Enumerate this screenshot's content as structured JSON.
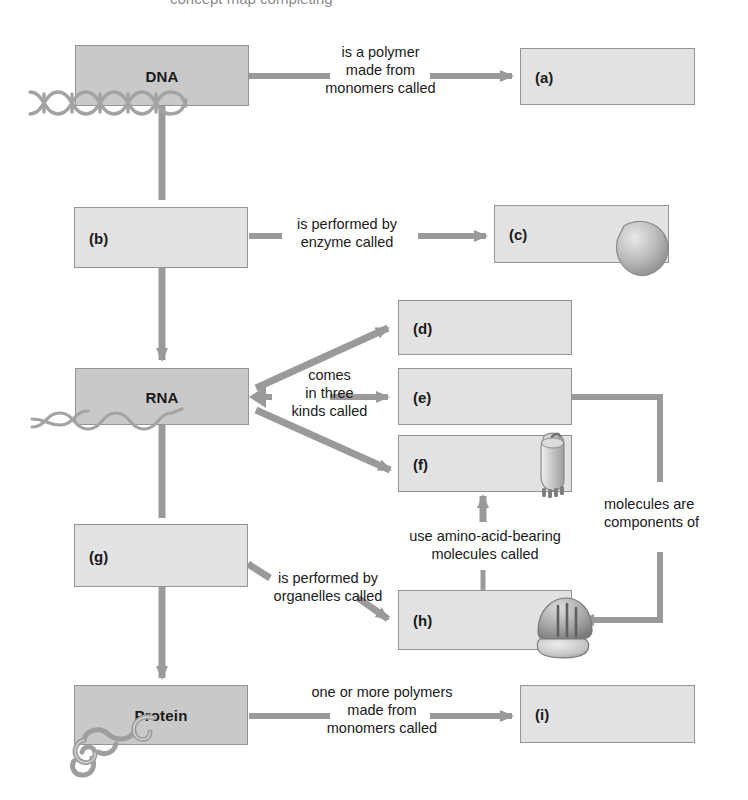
{
  "diagram": {
    "title_partial": "concept map completing",
    "type": "concept-map",
    "topic": "DNA to RNA to Protein (Central Dogma)",
    "colors": {
      "node_shaded_fill": "#c9c9c9",
      "node_light_fill": "#e2e2e2",
      "node_border": "#949494",
      "arrow": "#9a9a9a",
      "text": "#1a1a1a",
      "background": "#ffffff"
    },
    "nodes": [
      {
        "id": "dna",
        "label": "DNA",
        "style": "shaded",
        "align": "center",
        "x": 75,
        "y": 45,
        "w": 174,
        "h": 61
      },
      {
        "id": "a",
        "label": "(a)",
        "style": "light",
        "align": "left",
        "x": 520,
        "y": 48,
        "w": 175,
        "h": 57
      },
      {
        "id": "b",
        "label": "(b)",
        "style": "light",
        "align": "left",
        "x": 74,
        "y": 207,
        "w": 174,
        "h": 61
      },
      {
        "id": "c",
        "label": "(c)",
        "style": "light",
        "align": "left",
        "x": 494,
        "y": 205,
        "w": 175,
        "h": 58
      },
      {
        "id": "rna",
        "label": "RNA",
        "style": "shaded",
        "align": "center",
        "x": 75,
        "y": 368,
        "w": 174,
        "h": 57
      },
      {
        "id": "d",
        "label": "(d)",
        "style": "light",
        "align": "left",
        "x": 398,
        "y": 300,
        "w": 174,
        "h": 55
      },
      {
        "id": "e",
        "label": "(e)",
        "style": "light",
        "align": "left",
        "x": 398,
        "y": 368,
        "w": 174,
        "h": 57
      },
      {
        "id": "f",
        "label": "(f)",
        "style": "light",
        "align": "left",
        "x": 398,
        "y": 435,
        "w": 174,
        "h": 57
      },
      {
        "id": "g",
        "label": "(g)",
        "style": "light",
        "align": "left",
        "x": 74,
        "y": 524,
        "w": 174,
        "h": 63
      },
      {
        "id": "h",
        "label": "(h)",
        "style": "light",
        "align": "left",
        "x": 398,
        "y": 590,
        "w": 174,
        "h": 60
      },
      {
        "id": "protein",
        "label": "Protein",
        "style": "shaded",
        "align": "center",
        "x": 74,
        "y": 685,
        "w": 174,
        "h": 60
      },
      {
        "id": "i",
        "label": "(i)",
        "style": "light",
        "align": "left",
        "x": 520,
        "y": 685,
        "w": 175,
        "h": 58
      }
    ],
    "edge_labels": [
      {
        "id": "dna-to-a",
        "text": "is a polymer\nmade from\nmonomers called",
        "align": "center",
        "x": 268,
        "y": 44,
        "w": 225
      },
      {
        "id": "b-to-c",
        "text": "is performed by\nenzyme called",
        "align": "center",
        "x": 272,
        "y": 216,
        "w": 150
      },
      {
        "id": "rna-kinds",
        "text": "comes\nin three\nkinds called",
        "align": "center",
        "x": 272,
        "y": 367,
        "w": 115
      },
      {
        "id": "e-to-h",
        "text": "molecules are\ncomponents of",
        "align": "left",
        "x": 604,
        "y": 496,
        "w": 144
      },
      {
        "id": "h-to-f",
        "text": "use amino-acid-bearing\nmolecules called",
        "align": "center",
        "x": 378,
        "y": 528,
        "w": 214
      },
      {
        "id": "g-to-h",
        "text": "is performed by\norganelles called",
        "align": "center",
        "x": 248,
        "y": 570,
        "w": 160
      },
      {
        "id": "prot-to-i",
        "text": "one or more polymers\nmade from\nmonomers called",
        "align": "center",
        "x": 268,
        "y": 684,
        "w": 228
      }
    ],
    "decorations": [
      {
        "id": "dna-helix-icon",
        "description": "double helix strand at bottom-left of DNA box"
      },
      {
        "id": "rna-strand-icon",
        "description": "single wavy RNA strand at bottom-left of RNA box"
      },
      {
        "id": "enzyme-icon",
        "description": "rounded enzyme blob at right of box (c)"
      },
      {
        "id": "trna-icon",
        "description": "tRNA clover shape at right of box (f)"
      },
      {
        "id": "ribosome-icon",
        "description": "ribosome shape at right of box (h)"
      },
      {
        "id": "protein-icon",
        "description": "coiled protein chain at bottom-left of Protein box"
      }
    ]
  }
}
